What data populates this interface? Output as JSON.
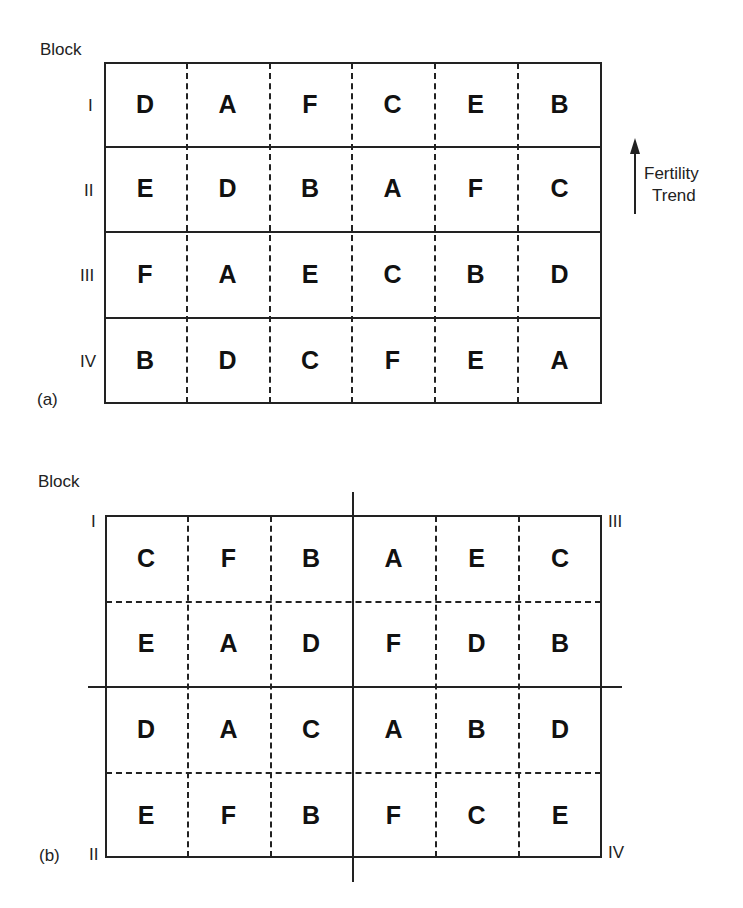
{
  "panel_a": {
    "block_header": "Block",
    "panel_label": "(a)",
    "rows": [
      {
        "block": "I",
        "cells": [
          "D",
          "A",
          "F",
          "C",
          "E",
          "B"
        ]
      },
      {
        "block": "II",
        "cells": [
          "E",
          "D",
          "B",
          "A",
          "F",
          "C"
        ]
      },
      {
        "block": "III",
        "cells": [
          "F",
          "A",
          "E",
          "C",
          "B",
          "D"
        ]
      },
      {
        "block": "IV",
        "cells": [
          "B",
          "D",
          "C",
          "F",
          "E",
          "A"
        ]
      }
    ],
    "trend": {
      "line1": "Fertility",
      "line2": "Trend",
      "icon": "up-arrow-icon"
    }
  },
  "panel_b": {
    "block_header": "Block",
    "panel_label": "(b)",
    "corner_blocks": {
      "top_left": "I",
      "top_right": "III",
      "bottom_left": "II",
      "bottom_right": "IV"
    },
    "rows": [
      {
        "cells": [
          "C",
          "F",
          "B",
          "A",
          "E",
          "C"
        ]
      },
      {
        "cells": [
          "E",
          "A",
          "D",
          "F",
          "D",
          "B"
        ]
      },
      {
        "cells": [
          "D",
          "A",
          "C",
          "A",
          "B",
          "D"
        ]
      },
      {
        "cells": [
          "E",
          "F",
          "B",
          "F",
          "C",
          "E"
        ]
      }
    ]
  },
  "colors": {
    "line": "#222222",
    "background": "#ffffff"
  }
}
